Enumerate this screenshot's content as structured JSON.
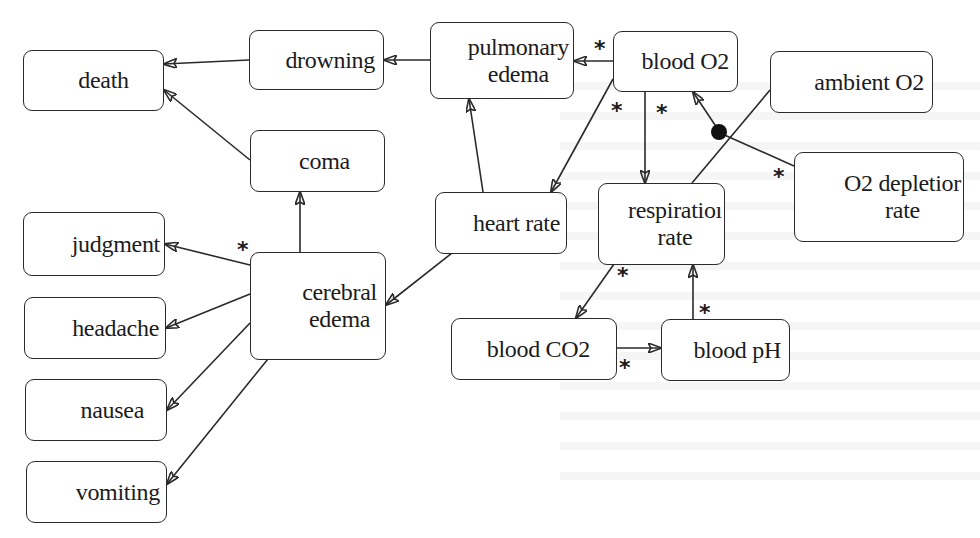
{
  "diagram": {
    "type": "causal-graph",
    "nodes": {
      "death": {
        "label": "death"
      },
      "drowning": {
        "label": "drowning"
      },
      "coma": {
        "label": "coma"
      },
      "pulmonary_edema": {
        "label": "pulmonary\nedema"
      },
      "blood_o2": {
        "label": "blood O2"
      },
      "ambient_o2": {
        "label": "ambient O2"
      },
      "o2_depletion_rate": {
        "label": "O2 depletior\nrate"
      },
      "heart_rate": {
        "label": "heart rate"
      },
      "respiration_rate": {
        "label": "respiratioı\nrate"
      },
      "cerebral_edema": {
        "label": "cerebral\nedema"
      },
      "judgment": {
        "label": "judgment"
      },
      "headache": {
        "label": "headache"
      },
      "nausea": {
        "label": "nausea"
      },
      "vomiting": {
        "label": "vomiting"
      },
      "blood_co2": {
        "label": "blood CO2"
      },
      "blood_ph": {
        "label": "blood pH"
      }
    },
    "edges": [
      {
        "from": "drowning",
        "to": "death",
        "marker": ""
      },
      {
        "from": "coma",
        "to": "death",
        "marker": ""
      },
      {
        "from": "pulmonary_edema",
        "to": "drowning",
        "marker": ""
      },
      {
        "from": "blood_o2",
        "to": "pulmonary_edema",
        "marker": "*"
      },
      {
        "from": "blood_o2",
        "to": "cerebral_edema",
        "marker": "*",
        "note": "via heart rate region (points to heart rate box)"
      },
      {
        "from": "blood_o2",
        "to": "heart_rate",
        "marker": "*"
      },
      {
        "from": "blood_o2",
        "to": "respiration_rate",
        "marker": "*"
      },
      {
        "from": "ambient_o2",
        "to": "blood_o2",
        "marker": "",
        "junction": "filled-dot"
      },
      {
        "from": "o2_depletion_rate",
        "to": "blood_o2",
        "marker": "*",
        "junction": "filled-dot"
      },
      {
        "from": "heart_rate",
        "to": "pulmonary_edema",
        "marker": ""
      },
      {
        "from": "heart_rate",
        "to": "cerebral_edema",
        "marker": ""
      },
      {
        "from": "cerebral_edema",
        "to": "coma",
        "marker": ""
      },
      {
        "from": "cerebral_edema",
        "to": "judgment",
        "marker": "*"
      },
      {
        "from": "cerebral_edema",
        "to": "headache",
        "marker": ""
      },
      {
        "from": "cerebral_edema",
        "to": "nausea",
        "marker": ""
      },
      {
        "from": "cerebral_edema",
        "to": "vomiting",
        "marker": ""
      },
      {
        "from": "respiration_rate",
        "to": "blood_co2",
        "marker": "*"
      },
      {
        "from": "blood_co2",
        "to": "blood_ph",
        "marker": "*"
      },
      {
        "from": "blood_ph",
        "to": "respiration_rate",
        "marker": "*"
      }
    ],
    "star_marker": "*",
    "colors": {
      "stroke": "#2a2a2a",
      "background": "#ffffff",
      "text": "#1c1c1c"
    }
  }
}
